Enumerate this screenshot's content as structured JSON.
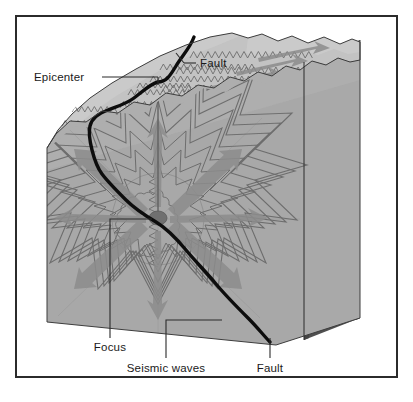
{
  "figure": {
    "type": "earthquake-block-diagram",
    "title_visible": false,
    "border_color": "#2b2b2b",
    "background_color": "#ffffff"
  },
  "labels": {
    "epicenter": "Epicenter",
    "fault_top": "Fault",
    "focus": "Focus",
    "seismic_waves": "Seismic waves",
    "fault_bottom": "Fault"
  },
  "colors": {
    "top_surface": "#c3c3c3",
    "front_face": "#a9a9a9",
    "right_face": "#4f4f4f",
    "wave_stroke": "#6e6e6e",
    "arrow_fill": "#8c8c8c",
    "fault_line": "#0d0d0d",
    "focus_marker": "#707070",
    "leader_line": "#2b2b2b",
    "label_text": "#1a1a1a"
  },
  "features": {
    "focus_marker_shape": "ellipse",
    "epicenter_marker_shape": "vertical-line-to-focus",
    "wave_pattern": "concentric-zigzag-rings",
    "arrow_direction": "radiating-outward"
  }
}
